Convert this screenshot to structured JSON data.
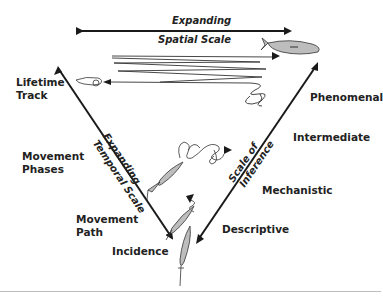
{
  "diagram": {
    "spatial_axis": {
      "line1": "Expanding",
      "line2": "Spatial Scale"
    },
    "temporal_axis": {
      "line1": "Expanding",
      "line2": "Temporal Scale"
    },
    "inference_axis": {
      "line1": "Scale of",
      "line2": "Inference"
    },
    "left_labels": [
      {
        "line1": "Lifetime",
        "line2": "Track"
      },
      {
        "line1": "Movement",
        "line2": "Phases"
      },
      {
        "line1": "Movement",
        "line2": "Path"
      },
      {
        "line1": "Incidence",
        "line2": ""
      }
    ],
    "right_labels": [
      "Phenomenal",
      "Intermediate",
      "Mechanistic",
      "Descriptive"
    ],
    "colors": {
      "ink": "#1a1a1a",
      "fish_fill": "#bdbdbd",
      "rule": "#bdbdbd"
    }
  }
}
